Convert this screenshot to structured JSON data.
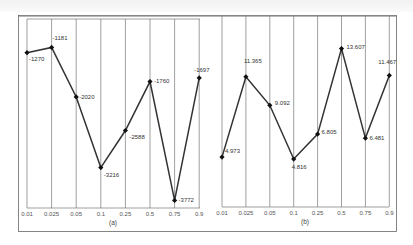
{
  "figure": {
    "panels": [
      {
        "caption": "(a)"
      },
      {
        "caption": "(b)"
      }
    ]
  },
  "chart_data": [
    {
      "type": "line",
      "title": "(a)",
      "xlabel": "",
      "ylabel": "",
      "categories": [
        "0.01",
        "0.025",
        "0.05",
        "0.1",
        "0.25",
        "0.5",
        "0.75",
        "0.9"
      ],
      "values": [
        -1270,
        -1181,
        -2020,
        -3216,
        -2588,
        -1760,
        -3772,
        -1697
      ],
      "data_labels": [
        "-1270",
        "-1181",
        "-2020",
        "-3216",
        "-2588",
        "-1760",
        "-3772",
        "-1697"
      ],
      "grid": {
        "vertical": true,
        "horizontal": false
      },
      "color": "#333333"
    },
    {
      "type": "line",
      "title": "(b)",
      "xlabel": "",
      "ylabel": "",
      "categories": [
        "0.01",
        "0.025",
        "0.05",
        "0.1",
        "0.25",
        "0.5",
        "0.75",
        "0.9"
      ],
      "values": [
        4.973,
        11.365,
        9.092,
        4.816,
        6.805,
        13.607,
        6.481,
        11.467
      ],
      "data_labels": [
        "4.973",
        "11.365",
        "9.092",
        "4.816",
        "6.805",
        "13.607",
        "6.481",
        "11.467"
      ],
      "grid": {
        "vertical": true,
        "horizontal": false
      },
      "color": "#333333"
    }
  ]
}
